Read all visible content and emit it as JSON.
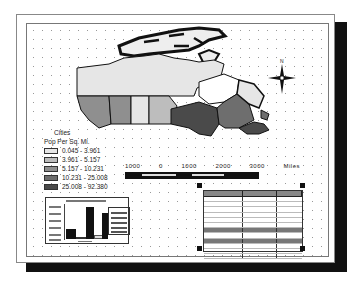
{
  "compass": {
    "north_label": "N"
  },
  "legend": {
    "title": "Cities",
    "subtitle": "Pop Per Sq. Mi.",
    "classes": [
      {
        "label": "0.045 - 3.961",
        "color": "#e6e6e6"
      },
      {
        "label": "3.961 - 5.157",
        "color": "#bdbdbd"
      },
      {
        "label": "5.157 - 10.231",
        "color": "#8f8f8f"
      },
      {
        "label": "10.231 - 25.008",
        "color": "#6e6e6e"
      },
      {
        "label": "25.008 - 92.380",
        "color": "#4a4a4a"
      }
    ]
  },
  "scale_bar": {
    "labels": [
      "1000",
      "0",
      "1000",
      "2000",
      "3000"
    ],
    "units": "Miles"
  },
  "chart": {
    "type": "bar",
    "bars": [
      {
        "height_pct": 28,
        "color": "#111111"
      },
      {
        "height_pct": 6,
        "color": "#333333"
      },
      {
        "height_pct": 92,
        "color": "#111111"
      },
      {
        "height_pct": 6,
        "color": "#dddddd"
      },
      {
        "height_pct": 75,
        "color": "#111111"
      }
    ]
  },
  "table": {
    "row_count": 13,
    "dark_rows": [
      7,
      10
    ]
  }
}
